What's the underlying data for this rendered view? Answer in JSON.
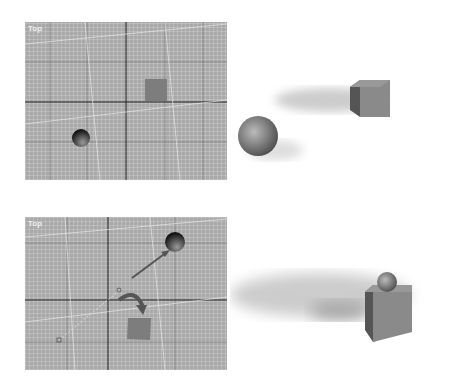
{
  "viewports": [
    {
      "label": "Top",
      "objects": [
        "box",
        "sphere"
      ]
    },
    {
      "label": "Top",
      "objects": [
        "box",
        "sphere",
        "rotate-arrow",
        "move-arrow"
      ]
    }
  ],
  "renders": [
    {
      "scene": "sphere and box apart"
    },
    {
      "scene": "sphere on top of box"
    }
  ],
  "colors": {
    "viewport_bg": "#a9a9a9",
    "grid_dark": "#333333",
    "box": "#7a7a7a"
  }
}
